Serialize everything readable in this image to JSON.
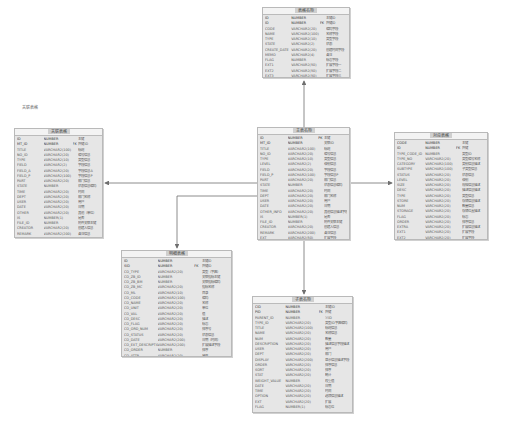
{
  "diagram": {
    "type": "entity-relationship",
    "entities": [
      {
        "id": "top",
        "title": "表格名称",
        "rows": [
          {
            "name": "ID",
            "type": "NUMBER",
            "key": "",
            "comment": "主键ID"
          },
          {
            "name": "ID",
            "type": "NUMBER",
            "key": "FK",
            "comment": "外键ID"
          },
          {
            "name": "CODE",
            "type": "VARCHAR2(20)",
            "key": "",
            "comment": "编码字段"
          },
          {
            "name": "NAME",
            "type": "VARCHAR2(100)",
            "key": "",
            "comment": "名称字段"
          },
          {
            "name": "TYPE",
            "type": "VARCHAR2(10)",
            "key": "",
            "comment": "类型字段"
          },
          {
            "name": "STATE",
            "type": "VARCHAR2(2)",
            "key": "",
            "comment": "状态"
          },
          {
            "name": "CREATE_DATE",
            "type": "VARCHAR2(20)",
            "key": "",
            "comment": "创建时间字段"
          },
          {
            "name": "MEMO",
            "type": "VARCHAR2(4)",
            "key": "",
            "comment": "备注"
          },
          {
            "name": "FLAG",
            "type": "NUMBER",
            "key": "",
            "comment": "标志字段"
          },
          {
            "name": "EXT1",
            "type": "VARCHAR2(50)",
            "key": "",
            "comment": "扩展字段一"
          },
          {
            "name": "EXT2",
            "type": "VARCHAR2(50)",
            "key": "",
            "comment": "扩展字段二"
          },
          {
            "name": "EXT3",
            "type": "VARCHAR2(50)",
            "key": "",
            "comment": "扩展字段三"
          }
        ]
      },
      {
        "id": "center",
        "title": "主表名称",
        "rows": [
          {
            "name": "ID",
            "type": "NUMBER",
            "key": "PK",
            "comment": "主键"
          },
          {
            "name": "MT_ID",
            "type": "NUMBER",
            "key": "",
            "comment": "关联ID"
          },
          {
            "name": "TITLE",
            "type": "VARCHAR2(100)",
            "key": "",
            "comment": "标题"
          },
          {
            "name": "NO_ID",
            "type": "VARCHAR2(20)",
            "key": "",
            "comment": "编号信息"
          },
          {
            "name": "TYPE",
            "type": "VARCHAR2(10)",
            "key": "",
            "comment": "类型信息"
          },
          {
            "name": "LEVEL",
            "type": "VARCHAR2(2)",
            "key": "",
            "comment": "级别信息"
          },
          {
            "name": "FIELD",
            "type": "VARCHAR2(20)",
            "key": "",
            "comment": "字段信息"
          },
          {
            "name": "FIELD_P",
            "type": "VARCHAR2(100)",
            "key": "",
            "comment": "字段信息P"
          },
          {
            "name": "PART",
            "type": "VARCHAR2(20)",
            "key": "",
            "comment": "部门信息"
          },
          {
            "name": "STATE",
            "type": "NUMBER",
            "key": "",
            "comment": "状态信息编码"
          },
          {
            "name": "TIME",
            "type": "VARCHAR2(20)",
            "key": "",
            "comment": "时间"
          },
          {
            "name": "DEPT",
            "type": "VARCHAR2(20)",
            "key": "",
            "comment": "部门名称"
          },
          {
            "name": "USER",
            "type": "VARCHAR2(20)",
            "key": "",
            "comment": "用户"
          },
          {
            "name": "DATE",
            "type": "VARCHAR2(20)",
            "key": "",
            "comment": "日期"
          },
          {
            "name": "OTHER_INFO",
            "type": "VARCHAR2(20)",
            "key": "",
            "comment": "其他信息描述字段"
          },
          {
            "name": "IS",
            "type": "NUMBER(1)",
            "key": "",
            "comment": "是否"
          },
          {
            "name": "FILE_ID",
            "type": "NUMBER",
            "key": "",
            "comment": "附件关联主键"
          },
          {
            "name": "CREATOR",
            "type": "VARCHAR2(20)",
            "key": "",
            "comment": "创建人信息"
          },
          {
            "name": "REMARK",
            "type": "VARCHAR2(200)",
            "key": "",
            "comment": "备注信息"
          },
          {
            "name": "EXT",
            "type": "VARCHAR2(50)",
            "key": "",
            "comment": "扩展字段"
          }
        ]
      },
      {
        "id": "left",
        "title": "关联表格",
        "rows": [
          {
            "name": "ID",
            "type": "NUMBER",
            "key": "",
            "comment": "主键"
          },
          {
            "name": "MT_ID",
            "type": "NUMBER",
            "key": "FK",
            "comment": "外键ID"
          },
          {
            "name": "TITLE",
            "type": "VARCHAR2(100)",
            "key": "",
            "comment": "标题"
          },
          {
            "name": "NO_ID",
            "type": "VARCHAR2(20)",
            "key": "",
            "comment": "编号信息"
          },
          {
            "name": "TYPE",
            "type": "VARCHAR2(10)",
            "key": "",
            "comment": "类型信息"
          },
          {
            "name": "FIELD",
            "type": "VARCHAR2(2)",
            "key": "",
            "comment": "字段信息"
          },
          {
            "name": "FIELD_A",
            "type": "VARCHAR2(20)",
            "key": "",
            "comment": "字段信息A"
          },
          {
            "name": "FIELD_P",
            "type": "VARCHAR2(100)",
            "key": "",
            "comment": "字段信息P"
          },
          {
            "name": "PART",
            "type": "VARCHAR2(20)",
            "key": "",
            "comment": "部门信息"
          },
          {
            "name": "STATE",
            "type": "NUMBER",
            "key": "",
            "comment": "状态信息编码"
          },
          {
            "name": "TIME",
            "type": "VARCHAR2(20)",
            "key": "",
            "comment": "时间"
          },
          {
            "name": "DEPT",
            "type": "VARCHAR2(20)",
            "key": "",
            "comment": "部门名称"
          },
          {
            "name": "USER",
            "type": "VARCHAR2(20)",
            "key": "",
            "comment": "用户"
          },
          {
            "name": "DATE",
            "type": "VARCHAR2(20)",
            "key": "",
            "comment": "日期"
          },
          {
            "name": "OTHER",
            "type": "VARCHAR2(20)",
            "key": "",
            "comment": "其他（单位）"
          },
          {
            "name": "IS",
            "type": "NUMBER(1)",
            "key": "",
            "comment": "是否"
          },
          {
            "name": "FILE_ID",
            "type": "NUMBER",
            "key": "",
            "comment": "附件关联主键"
          },
          {
            "name": "CREATOR",
            "type": "VARCHAR2(20)",
            "key": "",
            "comment": "创建人信息"
          },
          {
            "name": "REMARK",
            "type": "VARCHAR2(200)",
            "key": "",
            "comment": "备注信息"
          },
          {
            "name": "EXT",
            "type": "VARCHAR2(50)",
            "key": "",
            "comment": "扩展字段"
          }
        ]
      },
      {
        "id": "right",
        "title": "对应表格",
        "rows": [
          {
            "name": "CODE",
            "type": "NUMBER",
            "key": "",
            "comment": "主键"
          },
          {
            "name": "ID",
            "type": "NUMBER",
            "key": "FK",
            "comment": "外键"
          },
          {
            "name": "TYPE_CODE_ID",
            "type": "NUMBER",
            "key": "",
            "comment": "类型ID"
          },
          {
            "name": "TYPE_NO",
            "type": "VARCHAR2(20)",
            "key": "",
            "comment": "类型编号名称"
          },
          {
            "name": "CATEGORY",
            "type": "VARCHAR2(100)",
            "key": "",
            "comment": "类别信息描述"
          },
          {
            "name": "SUBTYPE",
            "type": "VARCHAR2(100)",
            "key": "",
            "comment": "子类型信息"
          },
          {
            "name": "STATUS",
            "type": "VARCHAR2(20)",
            "key": "",
            "comment": "状态信息"
          },
          {
            "name": "LEVEL",
            "type": "VARCHAR2(20)",
            "key": "",
            "comment": "级别"
          },
          {
            "name": "SIZE",
            "type": "VARCHAR2(20)",
            "key": "",
            "comment": "规格信息描述"
          },
          {
            "name": "DESC",
            "type": "VARCHAR2(20)",
            "key": "",
            "comment": "描述信息描述"
          },
          {
            "name": "TYPE",
            "type": "VARCHAR2(20)",
            "key": "",
            "comment": "类型信息"
          },
          {
            "name": "STORE",
            "type": "VARCHAR2(20)",
            "key": "",
            "comment": "存储信息描述"
          },
          {
            "name": "NUM",
            "type": "VARCHAR2(20)",
            "key": "",
            "comment": "数量信息"
          },
          {
            "name": "STORAGE",
            "type": "VARCHAR2(20)",
            "key": "",
            "comment": "存储位置描述"
          },
          {
            "name": "FLAG",
            "type": "VARCHAR2(20)",
            "key": "",
            "comment": "标志"
          },
          {
            "name": "ORDER",
            "type": "VARCHAR2(20)",
            "key": "",
            "comment": "排序信息"
          },
          {
            "name": "EXTRA",
            "type": "VARCHAR2(20)",
            "key": "",
            "comment": "扩展信息描述"
          },
          {
            "name": "EXT1",
            "type": "VARCHAR2(20)",
            "key": "",
            "comment": "扩展字段"
          },
          {
            "name": "EXT2",
            "type": "VARCHAR2(20)",
            "key": "",
            "comment": "扩展字段"
          },
          {
            "name": "EXT3",
            "type": "VARCHAR2(20)",
            "key": "",
            "comment": "扩展字段"
          }
        ]
      },
      {
        "id": "bottom-left",
        "title": "明细表格",
        "rows": [
          {
            "name": "ID",
            "type": "NUMBER",
            "key": "",
            "comment": "主键ID"
          },
          {
            "name": "SID",
            "type": "NUMBER",
            "key": "FK",
            "comment": "外键ID"
          },
          {
            "name": "CO_TYPE",
            "type": "VARCHAR2(20)",
            "key": "",
            "comment": "类型（字典）"
          },
          {
            "name": "CO_ZB_ID",
            "type": "NUMBER",
            "key": "",
            "comment": "关联指标主键"
          },
          {
            "name": "CO_ZB_BM",
            "type": "NUMBER",
            "key": "",
            "comment": "关联指标编码"
          },
          {
            "name": "CO_ZB_MC",
            "type": "VARCHAR2(20)",
            "key": "",
            "comment": "指标名称"
          },
          {
            "name": "CO_ML",
            "type": "VARCHAR2(10)",
            "key": "",
            "comment": "目录"
          },
          {
            "name": "CO_CODE",
            "type": "VARCHAR2(100)",
            "key": "",
            "comment": "编码"
          },
          {
            "name": "CO_NAME",
            "type": "VARCHAR2(20)",
            "key": "",
            "comment": "名称"
          },
          {
            "name": "CO_UNIT",
            "type": "VARCHAR2(20)",
            "key": "",
            "comment": "单位"
          },
          {
            "name": "CO_VAL",
            "type": "VARCHAR2(20)",
            "key": "",
            "comment": "值"
          },
          {
            "name": "CO_DESC",
            "type": "VARCHAR2(20)",
            "key": "",
            "comment": "描述"
          },
          {
            "name": "CO_FLAG",
            "type": "VARCHAR2(20)",
            "key": "",
            "comment": "标志"
          },
          {
            "name": "CO_ORD_NUM",
            "type": "VARCHAR2(20)",
            "key": "",
            "comment": "排序号"
          },
          {
            "name": "CO_STATUS",
            "type": "VARCHAR2(20)",
            "key": "",
            "comment": "状态信息"
          },
          {
            "name": "CO_DATE",
            "type": "VARCHAR2(200)",
            "key": "",
            "comment": "日期（时间）"
          },
          {
            "name": "CO_EXT_DESCRIPTION",
            "type": "VARCHAR2(200)",
            "key": "",
            "comment": "扩展描述字段"
          },
          {
            "name": "CO_ORDER",
            "type": "NUMBER",
            "key": "",
            "comment": "排序"
          },
          {
            "name": "CO_ATTR",
            "type": "VARCHAR2(20)",
            "key": "",
            "comment": "属性"
          },
          {
            "name": "CO_EXTRA",
            "type": "VARCHAR2(20)",
            "key": "",
            "comment": "扩展"
          }
        ]
      },
      {
        "id": "bottom-center",
        "title": "子表名称",
        "rows": [
          {
            "name": "CID",
            "type": "NUMBER",
            "key": "",
            "comment": "主键ID"
          },
          {
            "name": "PID",
            "type": "NUMBER",
            "key": "FK",
            "comment": "外键"
          },
          {
            "name": "PARENT_ID",
            "type": "NUMBER",
            "key": "",
            "comment": "父ID"
          },
          {
            "name": "TYPE_ID",
            "type": "VARCHAR2(20)",
            "key": "",
            "comment": "类型ID字典编码"
          },
          {
            "name": "TITLE",
            "type": "VARCHAR2(100)",
            "key": "",
            "comment": "标题信息"
          },
          {
            "name": "NAME",
            "type": "VARCHAR2(20)",
            "key": "",
            "comment": "名称信息"
          },
          {
            "name": "NUM",
            "type": "VARCHAR2(20)",
            "key": "",
            "comment": "数量"
          },
          {
            "name": "DESCRIPTION",
            "type": "VARCHAR2(20)",
            "key": "",
            "comment": "描述信息字段描述"
          },
          {
            "name": "USER",
            "type": "VARCHAR2(20)",
            "key": "",
            "comment": "用户"
          },
          {
            "name": "DEPT",
            "type": "VARCHAR2(20)",
            "key": "",
            "comment": "部门"
          },
          {
            "name": "DISPLAY",
            "type": "VARCHAR2(200)",
            "key": "",
            "comment": "显示信息描述字段"
          },
          {
            "name": "ORDER",
            "type": "VARCHAR2(20)",
            "key": "",
            "comment": "排序信息"
          },
          {
            "name": "SORT",
            "type": "VARCHAR2(20)",
            "key": "",
            "comment": "排序"
          },
          {
            "name": "STAT",
            "type": "VARCHAR2(20)",
            "key": "",
            "comment": "统计"
          },
          {
            "name": "WEIGHT_VALUE",
            "type": "NUMBER",
            "key": "",
            "comment": "权重值"
          },
          {
            "name": "DATE",
            "type": "VARCHAR2(20)",
            "key": "",
            "comment": "日期"
          },
          {
            "name": "TIME",
            "type": "VARCHAR2(20)",
            "key": "",
            "comment": "时间"
          },
          {
            "name": "OPTION",
            "type": "VARCHAR2(20)",
            "key": "",
            "comment": "选项信息描述"
          },
          {
            "name": "EXT",
            "type": "VARCHAR2(20)",
            "key": "",
            "comment": "扩展"
          },
          {
            "name": "FLAG",
            "type": "NUMBER(1)",
            "key": "",
            "comment": "标志位"
          }
        ]
      }
    ],
    "floating_label": "关联表格",
    "relations": [
      {
        "from": "center",
        "to": "top",
        "direction": "up"
      },
      {
        "from": "center",
        "to": "left",
        "direction": "left"
      },
      {
        "from": "center",
        "to": "right",
        "direction": "right"
      },
      {
        "from": "center",
        "to": "bottom-left",
        "direction": "down-left"
      },
      {
        "from": "center",
        "to": "bottom-center",
        "direction": "down"
      }
    ],
    "colors": {
      "entity_fill": "#e6e6e6",
      "entity_border": "#b9b9b9",
      "line": "#6f6f6f"
    }
  }
}
